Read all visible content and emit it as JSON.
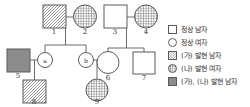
{
  "diagram": {
    "type": "pedigree-chart",
    "stroke_color": "#555555",
    "hatch_color": "#808080",
    "solid_fill": "#8c8c8c",
    "individuals": [
      {
        "id": "1",
        "label": "1",
        "sex": "male",
        "shape": "square",
        "fill": "hatch",
        "generation": 1
      },
      {
        "id": "2",
        "label": "2",
        "sex": "female",
        "shape": "circle",
        "fill": "crosshatch",
        "generation": 1
      },
      {
        "id": "3",
        "label": "3",
        "sex": "male",
        "shape": "square",
        "fill": "none",
        "generation": 1
      },
      {
        "id": "4",
        "label": "4",
        "sex": "female",
        "shape": "circle",
        "fill": "crosshatch",
        "generation": 1
      },
      {
        "id": "5",
        "label": "5",
        "sex": "male",
        "shape": "square",
        "fill": "solid",
        "generation": 2
      },
      {
        "id": "a",
        "label": "ⓐ",
        "sex": "female",
        "shape": "circle",
        "fill": "none",
        "generation": 2
      },
      {
        "id": "b",
        "label": "ⓑ",
        "sex": "female",
        "shape": "circle",
        "fill": "none",
        "generation": 2
      },
      {
        "id": "6",
        "label": "6",
        "sex": "female",
        "shape": "circle",
        "fill": "none",
        "generation": 2
      },
      {
        "id": "7",
        "label": "7",
        "sex": "male",
        "shape": "square",
        "fill": "none",
        "generation": 2
      },
      {
        "id": "8",
        "label": "8",
        "sex": "male",
        "shape": "square",
        "fill": "hatch",
        "generation": 3
      },
      {
        "id": "9",
        "label": "9",
        "sex": "female",
        "shape": "circle",
        "fill": "crosshatch",
        "generation": 3
      }
    ],
    "matings": [
      {
        "partners": [
          "1",
          "2"
        ],
        "children": [
          "a",
          "b"
        ]
      },
      {
        "partners": [
          "3",
          "4"
        ],
        "children": [
          "6",
          "7"
        ]
      },
      {
        "partners": [
          "5",
          "a"
        ],
        "children": [
          "8"
        ]
      },
      {
        "partners": [
          "b",
          "6"
        ],
        "children": [
          "9"
        ]
      }
    ]
  },
  "legend": {
    "items": [
      {
        "symbol": "empty-square",
        "label": "정상 남자"
      },
      {
        "symbol": "empty-circle",
        "label": "정상 여자"
      },
      {
        "symbol": "hatched-square",
        "label": "(가) 발현 남자"
      },
      {
        "symbol": "crosshatch-circle",
        "label": "(나) 발현 여자"
      },
      {
        "symbol": "solid-square",
        "label": "(가), (나) 발현 남자"
      }
    ]
  }
}
